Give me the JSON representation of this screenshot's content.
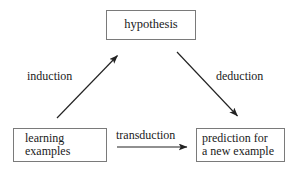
{
  "diagram": {
    "title_visible": false,
    "background_color": "#ffffff",
    "stroke_color": "#222222",
    "box_border_color": "#7a7a7a",
    "nodes": [
      {
        "id": "hypothesis",
        "label": "hypothesis",
        "lines": [
          "hypothesis"
        ],
        "shape": "rectangle",
        "align": "center"
      },
      {
        "id": "learning-examples",
        "label": "learning examples",
        "lines": [
          "learning",
          "examples"
        ],
        "shape": "rectangle",
        "align": "left"
      },
      {
        "id": "prediction",
        "label": "prediction for a new example",
        "lines": [
          "prediction for",
          "a new example"
        ],
        "shape": "rectangle",
        "align": "left"
      }
    ],
    "edges": [
      {
        "id": "induction",
        "label": "induction",
        "from": "learning-examples",
        "to": "hypothesis",
        "direction": "up-right",
        "arrowhead": "end"
      },
      {
        "id": "deduction",
        "label": "deduction",
        "from": "hypothesis",
        "to": "prediction",
        "direction": "down-right",
        "arrowhead": "end"
      },
      {
        "id": "transduction",
        "label": "transduction",
        "from": "learning-examples",
        "to": "prediction",
        "direction": "right",
        "arrowhead": "end"
      }
    ]
  }
}
